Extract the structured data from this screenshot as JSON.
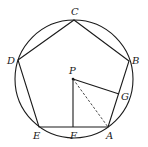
{
  "diagram": {
    "type": "geometry",
    "circle": {
      "cx": 74,
      "cy": 79,
      "r": 59
    },
    "points": {
      "C": {
        "label": "C",
        "x": 74,
        "y": 20
      },
      "B": {
        "label": "B",
        "x": 129,
        "y": 61
      },
      "A": {
        "label": "A",
        "x": 108,
        "y": 127
      },
      "E": {
        "label": "E",
        "x": 39,
        "y": 127
      },
      "D": {
        "label": "D",
        "x": 18,
        "y": 60
      },
      "P": {
        "label": "P",
        "x": 73,
        "y": 79
      },
      "F": {
        "label": "F",
        "x": 73,
        "y": 127
      },
      "G": {
        "label": "G",
        "x": 119,
        "y": 94
      }
    },
    "labels": {
      "C": "C",
      "B": "B",
      "A": "A",
      "E": "E",
      "D": "D",
      "P": "P",
      "F": "F",
      "G": "G"
    },
    "segments": [
      {
        "from": "A",
        "to": "B",
        "style": "solid"
      },
      {
        "from": "B",
        "to": "C",
        "style": "solid"
      },
      {
        "from": "C",
        "to": "D",
        "style": "solid"
      },
      {
        "from": "D",
        "to": "E",
        "style": "solid"
      },
      {
        "from": "E",
        "to": "A",
        "style": "solid"
      },
      {
        "from": "P",
        "to": "F",
        "style": "solid"
      },
      {
        "from": "P",
        "to": "G",
        "style": "solid"
      },
      {
        "from": "P",
        "to": "A",
        "style": "dashed"
      }
    ],
    "colors": {
      "stroke": "#1a1a1a",
      "background": "#ffffff"
    }
  }
}
